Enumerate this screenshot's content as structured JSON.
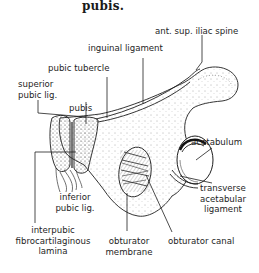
{
  "caption": {
    "text": "pubis."
  },
  "labels": {
    "ant_sup_iliac_spine": "ant. sup. iliac spine",
    "inguinal_ligament": "inguinal ligament",
    "pubic_tubercle": "pubic tubercle",
    "superior_pubic_lig_line1": "superior",
    "superior_pubic_lig_line2": "pubic lig.",
    "pubis": "pubis",
    "acetabulum": "acetabulum",
    "transverse_acetabular_ligament_line1": "transverse",
    "transverse_acetabular_ligament_line2": "acetabular",
    "transverse_acetabular_ligament_line3": "ligament",
    "inferior_pubic_lig_line1": "inferior",
    "inferior_pubic_lig_line2": "pubic lig.",
    "interpubic_line1": "interpubic",
    "interpubic_line2": "fibrocartilaginous",
    "interpubic_line3": "lamina",
    "obturator_membrane_line1": "obturator",
    "obturator_membrane_line2": "membrane",
    "obturator_canal": "obturator canal"
  },
  "colors": {
    "ink": "#1e1e1e",
    "background": "#ffffff"
  }
}
